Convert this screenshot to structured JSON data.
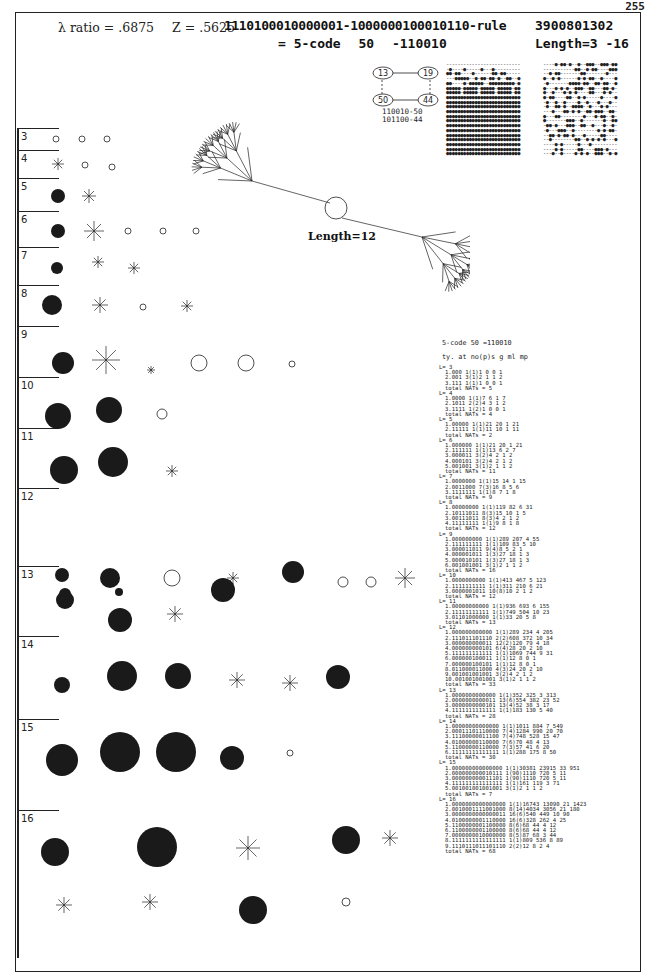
{
  "page": {
    "number": "255"
  },
  "header": {
    "lambda_label": "λ ratio = .6875",
    "z_label": "Z = .5625",
    "rule": "1110100010000001-1000000100010110-rule",
    "code_eq": "= 5-code",
    "code_num": "50",
    "code_bits": "-110010",
    "rule_number": "3900801302",
    "length_range": "Length=3 -16"
  },
  "basin": {
    "length_label": "Length=12"
  },
  "subnetwork": {
    "nodes": [
      "13",
      "19",
      "50",
      "44"
    ],
    "caption": [
      "110010-50",
      "101100-44"
    ]
  },
  "rows": [
    {
      "label": "3",
      "top": 128
    },
    {
      "label": "4",
      "top": 150
    },
    {
      "label": "5",
      "top": 178
    },
    {
      "label": "6",
      "top": 211
    },
    {
      "label": "7",
      "top": 247
    },
    {
      "label": "8",
      "top": 285
    },
    {
      "label": "9",
      "top": 326
    },
    {
      "label": "10",
      "top": 377
    },
    {
      "label": "11",
      "top": 428
    },
    {
      "label": "12",
      "top": 488
    },
    {
      "label": "13",
      "top": 566
    },
    {
      "label": "14",
      "top": 636
    },
    {
      "label": "15",
      "top": 719
    },
    {
      "label": "16",
      "top": 810
    }
  ],
  "table": {
    "title": "5-code  50 =110010",
    "columns": "ty. at no(p)s g ml mp",
    "blocks": [
      {
        "L": "L= 3",
        "lines": [
          "1.000 1(1)1 0 0 1",
          "2.001 3(1)2 1 1 2",
          "3.111 1(1)1 0 0 1"
        ],
        "total": "total NATs = 5"
      },
      {
        "L": "L= 4",
        "lines": [
          "1.0000 1(1)7 6 1 7",
          "2.1011 2(2)4 3 1 2",
          "3.1111 1(2)1 0 0 1"
        ],
        "total": "total NATs = 4"
      },
      {
        "L": "L= 5",
        "lines": [
          "1.00000 1(1)21 20 1 21",
          "2.11111 1(1)11 10 1 11"
        ],
        "total": "total NATs = 2"
      },
      {
        "L": "L= 6",
        "lines": [
          "1.000000 1(1)21 20 1 21",
          "2.111111 1(1)13 6 2 7",
          "3.000011 3(2)4 2 1 2",
          "4.000101 3(2)4 2 1 2",
          "5.001001 3(1)2 1 1 2"
        ],
        "total": "total NATs = 11"
      },
      {
        "L": "L= 7",
        "lines": [
          "1.0000000 1(1)15 14 1 15",
          "2.0011000 7(3)16 8 5 6",
          "3.1111111 1(1)8 7 1 8"
        ],
        "total": "total NATs = 9"
      },
      {
        "L": "L= 8",
        "lines": [
          "1.00000000 1(1)119 82 6 31",
          "2.10111011 8(3)15 10 1 5",
          "3.00111011 8(3)4 2 1 2",
          "4.11111111 1(1)9 8 1 8"
        ],
        "total": "total NATs = 12"
      },
      {
        "L": "L= 9",
        "lines": [
          "1.000000000 1(1)289 207 4 55",
          "2.111111111 1(1)109 83 5 10",
          "3.000011011 9(4)8 5 2 1",
          "4.000001011 1(3)27 18 1 3",
          "5.000010101 1(3)27 18 1 3",
          "6.001001001 3(1)2 1 1 2"
        ],
        "total": "total NATs = 16"
      },
      {
        "L": "L= 10",
        "lines": [
          "1.0000000000 1(1)413 467 5 123",
          "2.1111111111 1(1)311 210 6 21",
          "3.0000001011 10(8)10 2 1 2"
        ],
        "total": "total NATs = 12"
      },
      {
        "L": "L= 11",
        "lines": [
          "1.00000000000 1(1)936 693 6 155",
          "2.11111111111 1(1)749 504 10 23",
          "3.01101000000 1(1)33 20 5 8"
        ],
        "total": "total NATs = 13"
      },
      {
        "L": "L= 12",
        "lines": [
          "1.000000000000 1(1)289 234 4 205",
          "2.111011101110 2(2)608 372 10 34",
          "3.000000000011 12(2)120 79 4 18",
          "4.000000000101 6(4)28 20 2 10",
          "5.111111111111 1(1)1069 744 9 31",
          "6.000000100011 1(1)12 8 0 1",
          "7.000000100101 1(1)12 8 0 1",
          "8.011000011000 4(3)24 20 2 10",
          "9.001001001001 3(2)4 2 1 2",
          "10.001001001001 3(1)2 1 1 2"
        ],
        "total": "total NATs = 33"
      },
      {
        "L": "L= 13",
        "lines": [
          "1.0000000000000 1(1)352 325 3 313",
          "2.0000000000011 13(6)554 382 23 52",
          "3.0000000000101 13(4)52 38 3 17",
          "4.1111111111111 1(1)183 130 5 40"
        ],
        "total": "total NATs = 28"
      },
      {
        "L": "L= 14",
        "lines": [
          "1.00000000000000 1(1)1011 884 7 549",
          "2.00011101110000 7(4)1284 990 20 70",
          "3.11100000011100 7(4)748 528 15 47",
          "4.01000000110000 7(6)70 48 4 13",
          "5.11000000110000 7(3)57 41 6 20",
          "6.11111111111111 1(1)288 175 8 50"
        ],
        "total": "total NATs = 30"
      },
      {
        "L": "L= 15",
        "lines": [
          "1.000000000000000 1(1)30381 23915 33 951",
          "2.000000000010111 1(90)1110 720 5 11",
          "3.000000000011101 1(90)1110 720 5 11",
          "4.111111111111111 1(1)161 119 3 71",
          "5.001001001001001 3(1)2 1 1 2"
        ],
        "total": "total NATs = 7"
      },
      {
        "L": "L= 16",
        "lines": [
          "1.0000000000000000 1(1)16743 13090 21 1423",
          "2.0010001111001000 8(14)4034 3056 21 180",
          "3.0000000000000011 16(6)540 449 10 90",
          "4.0100000001110000 16(6)328 262 4 25",
          "5.1100000001100000 8(6)68 44 4 12",
          "6.1100000001100000 8(6)68 44 4 12",
          "7.0000000010000000 8(5)87 68 3 44",
          "8.1111111111111111 1(1)809 536 8 89",
          "9.1110111011101110 2(2)12 8 2 4"
        ],
        "total": "total NATs = 68"
      }
    ]
  }
}
